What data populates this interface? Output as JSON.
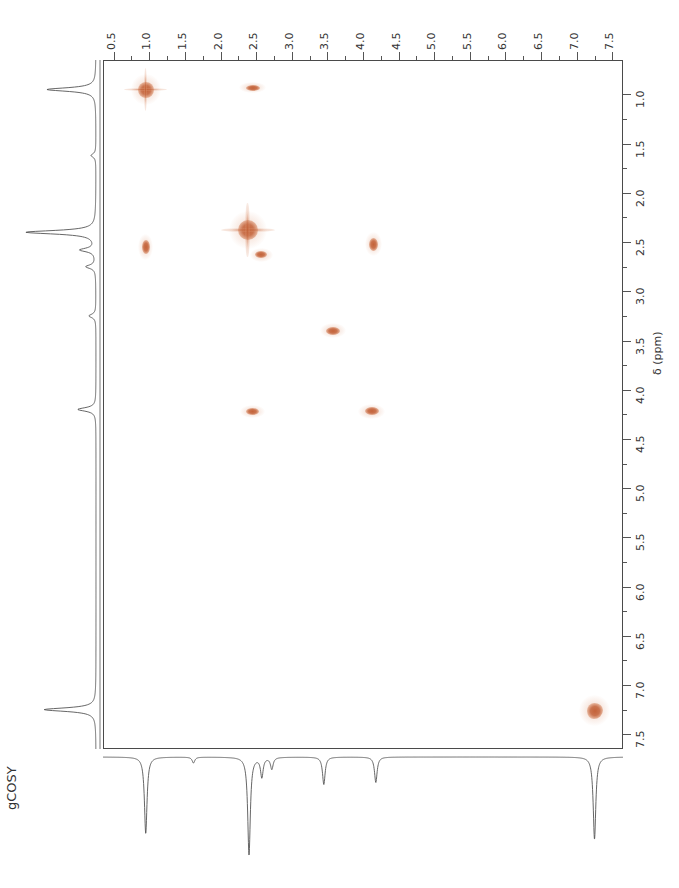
{
  "experiment": {
    "label": "gCOSY"
  },
  "axes": {
    "f2": {
      "orientation": "top",
      "unit": "ppm",
      "min": 0.5,
      "max": 7.5,
      "step": 0.5,
      "ticks": [
        "0.5",
        "1.0",
        "1.5",
        "2.0",
        "2.5",
        "3.0",
        "3.5",
        "4.0",
        "4.5",
        "5.0",
        "5.5",
        "6.0",
        "6.5",
        "7.0",
        "7.5"
      ],
      "direction": "left-to-right-increasing"
    },
    "f1": {
      "orientation": "right",
      "unit": "ppm",
      "title": "δ (ppm)",
      "min": 1.0,
      "max": 7.5,
      "step": 0.5,
      "ticks": [
        "1.0",
        "1.5",
        "2.0",
        "2.5",
        "3.0",
        "3.5",
        "4.0",
        "4.5",
        "5.0",
        "5.5",
        "6.0",
        "6.5",
        "7.0",
        "7.5"
      ],
      "direction": "top-to-bottom-increasing"
    }
  },
  "style": {
    "peak_color": "#c4633a",
    "peak_color_light": "#dc9470",
    "frame_color": "#4a4a4a",
    "trace_color": "#555555",
    "background": "#ffffff"
  },
  "chart_data": {
    "type": "scatter",
    "title": "gCOSY",
    "xlabel": "δ (ppm)",
    "ylabel": "δ (ppm)",
    "xlim": [
      0.35,
      7.65
    ],
    "ylim": [
      0.65,
      7.65
    ],
    "grid": false,
    "legend": "none",
    "peaks": [
      {
        "name": "diagonal-ch3-0.95",
        "f2": 0.95,
        "f1": 0.95,
        "w": 16,
        "h": 16,
        "shape": "star",
        "intensity": "strong"
      },
      {
        "name": "cross-2.45-0.95",
        "f2": 2.45,
        "f1": 0.93,
        "w": 14,
        "h": 6,
        "shape": "ellipse",
        "intensity": "medium"
      },
      {
        "name": "cross-0.95-2.55",
        "f2": 0.95,
        "f1": 2.55,
        "w": 8,
        "h": 14,
        "shape": "ellipse",
        "intensity": "medium"
      },
      {
        "name": "diagonal-2.38",
        "f2": 2.38,
        "f1": 2.38,
        "w": 20,
        "h": 20,
        "shape": "star",
        "intensity": "strong"
      },
      {
        "name": "cross-2.55-2.62",
        "f2": 2.57,
        "f1": 2.63,
        "w": 12,
        "h": 7,
        "shape": "ellipse",
        "intensity": "weak"
      },
      {
        "name": "cross-4.15-2.52",
        "f2": 4.15,
        "f1": 2.52,
        "w": 9,
        "h": 13,
        "shape": "ellipse",
        "intensity": "medium"
      },
      {
        "name": "diagonal-3.55",
        "f2": 3.58,
        "f1": 3.4,
        "w": 14,
        "h": 8,
        "shape": "ellipse",
        "intensity": "medium"
      },
      {
        "name": "cross-2.45-4.22",
        "f2": 2.45,
        "f1": 4.22,
        "w": 13,
        "h": 7,
        "shape": "ellipse",
        "intensity": "medium"
      },
      {
        "name": "cross-4.12-4.22",
        "f2": 4.12,
        "f1": 4.22,
        "w": 14,
        "h": 8,
        "shape": "ellipse",
        "intensity": "medium"
      },
      {
        "name": "diagonal-aromatic-7.26",
        "f2": 7.25,
        "f1": 7.26,
        "w": 16,
        "h": 16,
        "shape": "blob",
        "intensity": "strong"
      }
    ],
    "f2_projection_peaks": [
      {
        "ppm": 0.95,
        "height": 0.78
      },
      {
        "ppm": 1.62,
        "height": 0.06
      },
      {
        "ppm": 2.4,
        "height": 1.0
      },
      {
        "ppm": 2.58,
        "height": 0.2
      },
      {
        "ppm": 2.72,
        "height": 0.12
      },
      {
        "ppm": 3.45,
        "height": 0.28
      },
      {
        "ppm": 4.18,
        "height": 0.26
      },
      {
        "ppm": 7.25,
        "height": 0.84
      }
    ],
    "f1_projection_peaks": [
      {
        "ppm": 0.95,
        "height": 0.7
      },
      {
        "ppm": 1.62,
        "height": 0.07
      },
      {
        "ppm": 2.4,
        "height": 1.0
      },
      {
        "ppm": 2.58,
        "height": 0.22
      },
      {
        "ppm": 2.75,
        "height": 0.14
      },
      {
        "ppm": 3.25,
        "height": 0.1
      },
      {
        "ppm": 4.2,
        "height": 0.26
      },
      {
        "ppm": 7.25,
        "height": 0.74
      }
    ]
  }
}
